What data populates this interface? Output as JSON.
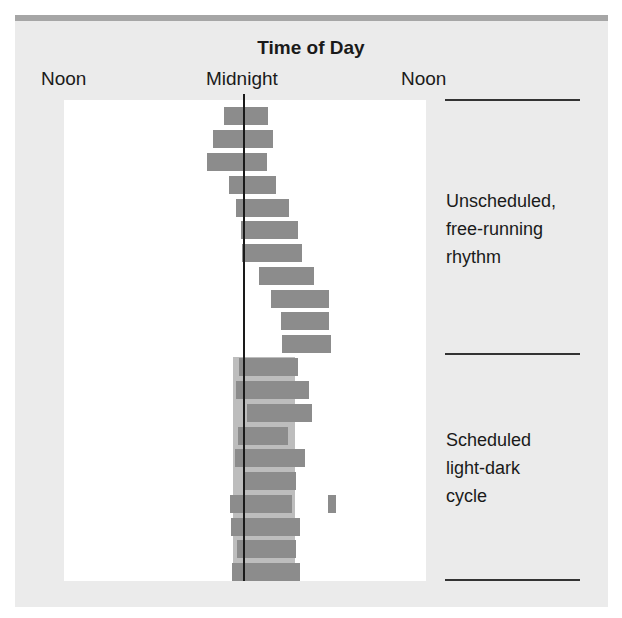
{
  "chart_data": {
    "type": "bar",
    "subtype": "actogram (horizontal floating bars of sleep periods per day)",
    "title": "Time of Day",
    "x_tick_labels": [
      "Noon",
      "Midnight",
      "Noon"
    ],
    "xlabel": "Time of Day",
    "ylabel": "",
    "x_axis_hours": "Noon (12) to Midnight (24) to Noon (36)",
    "reference_line": "Midnight",
    "grid": false,
    "legend": null,
    "sections": [
      {
        "label": "Unscheduled, free-running rhythm",
        "rows": [
          1,
          2,
          3,
          4,
          5,
          6,
          7,
          8,
          9,
          10,
          11
        ]
      },
      {
        "label": "Scheduled light-dark cycle",
        "rows": [
          12,
          13,
          14,
          15,
          16,
          17,
          18,
          19,
          20,
          21
        ]
      }
    ],
    "dark_period": {
      "start_hour": 22.9,
      "end_hour": 29.5,
      "rows": [
        12,
        21
      ]
    },
    "series": [
      {
        "name": "Sleep episodes",
        "bars": [
          {
            "row": 1,
            "start_hour": 21.9,
            "end_hour": 26.6
          },
          {
            "row": 2,
            "start_hour": 20.7,
            "end_hour": 27.1
          },
          {
            "row": 3,
            "start_hour": 20.1,
            "end_hour": 26.5
          },
          {
            "row": 4,
            "start_hour": 22.4,
            "end_hour": 27.5
          },
          {
            "row": 5,
            "start_hour": 23.2,
            "end_hour": 28.9
          },
          {
            "row": 6,
            "start_hour": 23.7,
            "end_hour": 29.8
          },
          {
            "row": 7,
            "start_hour": 23.8,
            "end_hour": 30.3
          },
          {
            "row": 8,
            "start_hour": 25.7,
            "end_hour": 31.5
          },
          {
            "row": 9,
            "start_hour": 26.9,
            "end_hour": 33.1
          },
          {
            "row": 10,
            "start_hour": 28.0,
            "end_hour": 33.1
          },
          {
            "row": 11,
            "start_hour": 28.1,
            "end_hour": 33.3
          },
          {
            "row": 12,
            "start_hour": 23.5,
            "end_hour": 29.8
          },
          {
            "row": 13,
            "start_hour": 23.2,
            "end_hour": 31.0
          },
          {
            "row": 14,
            "start_hour": 24.4,
            "end_hour": 31.3
          },
          {
            "row": 15,
            "start_hour": 23.4,
            "end_hour": 28.8
          },
          {
            "row": 16,
            "start_hour": 23.1,
            "end_hour": 30.6
          },
          {
            "row": 17,
            "start_hour": 24.1,
            "end_hour": 29.6
          },
          {
            "row": 18,
            "start_hour": 22.6,
            "end_hour": 29.2
          },
          {
            "row": 18,
            "start_hour": 33.0,
            "end_hour": 33.9
          },
          {
            "row": 19,
            "start_hour": 22.7,
            "end_hour": 30.0
          },
          {
            "row": 20,
            "start_hour": 23.3,
            "end_hour": 29.6
          },
          {
            "row": 21,
            "start_hour": 22.8,
            "end_hour": 30.0
          }
        ]
      }
    ]
  },
  "labels": {
    "title": "Time of Day",
    "tick_left": "Noon",
    "tick_mid": "Midnight",
    "tick_right": "Noon",
    "section_unscheduled": "Unscheduled,\nfree-running\nrhythm",
    "section_scheduled": "Scheduled\nlight-dark\ncycle"
  },
  "colors": {
    "panel_bg": "#ebebeb",
    "panel_topbar": "#a6a6a6",
    "plot_bg": "#ffffff",
    "bar": "#8c8c8c",
    "dark_band": "#bdbdbd",
    "midnight_line": "#1a1a1a"
  },
  "layout": {
    "plot_left": 64,
    "plot_top": 100,
    "px_per_hour": 9.36,
    "midnight_x": 243.5,
    "row_tops": [
      107,
      130,
      153,
      176,
      199,
      221,
      244,
      267,
      290,
      312,
      335,
      358,
      381,
      404,
      427,
      449,
      472,
      495,
      518,
      540,
      563
    ],
    "bar_height": 17.5
  }
}
